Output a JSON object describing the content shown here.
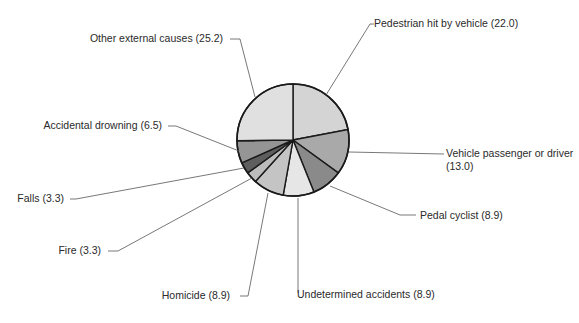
{
  "chart_data": {
    "type": "pie",
    "title": "",
    "start_angle_deg": 0,
    "direction": "clockwise",
    "center": [
      293,
      140
    ],
    "radius": 56,
    "slices": [
      {
        "label": "Pedestrian hit by vehicle",
        "value": 22.0,
        "color": "#d4d4d4",
        "text": "Pedestrian hit by vehicle (22.0)",
        "anchor": [
          331,
          16
        ],
        "text_pos": [
          374,
          27
        ],
        "text_anchor": "start",
        "leader": [
          [
            326,
            95
          ],
          [
            370,
            24
          ],
          [
            374,
            24
          ]
        ]
      },
      {
        "label": "Vehicle passenger or driver",
        "value": 13.0,
        "color": "#a9a9a9",
        "text": "Vehicle passenger or driver",
        "text2": "(13.0)",
        "text_pos": [
          446,
          157
        ],
        "text_anchor": "start",
        "leader": [
          [
            349,
            152
          ],
          [
            444,
            154
          ]
        ]
      },
      {
        "label": "Pedal cyclist",
        "value": 8.9,
        "color": "#8a8a8a",
        "text": "Pedal cyclist (8.9)",
        "text_pos": [
          420,
          219
        ],
        "text_anchor": "start",
        "leader": [
          [
            330,
            186
          ],
          [
            400,
            215
          ],
          [
            416,
            215
          ]
        ]
      },
      {
        "label": "Undetermined accidents",
        "value": 8.9,
        "color": "#e6e6e6",
        "text": "Undetermined accidents (8.9)",
        "text_pos": [
          297,
          298
        ],
        "text_anchor": "start",
        "leader": [
          [
            298,
            198
          ],
          [
            298,
            293
          ]
        ]
      },
      {
        "label": "Homicide",
        "value": 8.9,
        "color": "#c4c4c4",
        "text": "Homicide (8.9)",
        "text_pos": [
          230,
          299
        ],
        "text_anchor": "end",
        "leader": [
          [
            268,
            193
          ],
          [
            248,
            296
          ],
          [
            240,
            296
          ]
        ]
      },
      {
        "label": "Fire",
        "value": 3.3,
        "color": "#bcbcbc",
        "text": "Fire (3.3)",
        "text_pos": [
          101,
          254
        ],
        "text_anchor": "end",
        "leader": [
          [
            252,
            178
          ],
          [
            118,
            251
          ],
          [
            108,
            251
          ]
        ]
      },
      {
        "label": "Falls",
        "value": 3.3,
        "color": "#5e5e5e",
        "text": "Falls (3.3)",
        "text_pos": [
          64,
          202
        ],
        "text_anchor": "end",
        "leader": [
          [
            244,
            168
          ],
          [
            76,
            199
          ],
          [
            70,
            199
          ]
        ]
      },
      {
        "label": "Accidental drowning",
        "value": 6.5,
        "color": "#959595",
        "text": "Accidental drowning (6.5)",
        "text_pos": [
          162,
          129
        ],
        "text_anchor": "end",
        "leader": [
          [
            239,
            151
          ],
          [
            176,
            126
          ],
          [
            168,
            126
          ]
        ]
      },
      {
        "label": "Other external causes",
        "value": 25.2,
        "color": "#e0e0e0",
        "text": "Other external causes (25.2)",
        "text_pos": [
          223,
          42
        ],
        "text_anchor": "end",
        "leader": [
          [
            255,
            97
          ],
          [
            240,
            39
          ],
          [
            230,
            39
          ]
        ]
      }
    ],
    "legend": "none (direct labels with leader lines)",
    "total": 100.0
  }
}
